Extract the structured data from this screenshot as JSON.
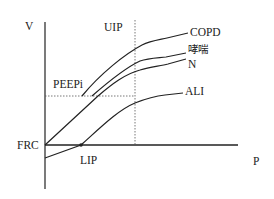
{
  "diagram": {
    "axes": {
      "y_label": "V",
      "x_label": "P",
      "origin_label": "FRC"
    },
    "markers": {
      "upper_inflection": "UIP",
      "lower_inflection": "LIP",
      "intrinsic_peep": "PEEPi"
    },
    "curves": [
      {
        "name": "COPD",
        "label": "COPD"
      },
      {
        "name": "asthma",
        "label": "哮喘"
      },
      {
        "name": "normal",
        "label": "N"
      },
      {
        "name": "ali",
        "label": "ALI"
      }
    ],
    "colors": {
      "line": "#222222",
      "dashed": "#555555",
      "background": "#ffffff"
    }
  }
}
